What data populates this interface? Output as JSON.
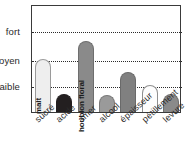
{
  "chart_data": {
    "type": "bar",
    "title": "",
    "xlabel": "",
    "ylabel": "",
    "categories": [
      "sucré",
      "acide",
      "amer",
      "alcool",
      "épaisseur",
      "pétillement",
      "levure"
    ],
    "values": [
      "moyen",
      "très faible",
      "entre moyen et fort",
      "très faible",
      "entre faible et moyen",
      "faible",
      "très faible"
    ],
    "ytick_labels": [
      "fort",
      "moyen",
      "faible"
    ],
    "ylim": [
      "nul",
      "fort+"
    ],
    "grid": true,
    "legend": "none",
    "bars": [
      {
        "category": "sucré",
        "level_label": "moyen",
        "value": 0.49,
        "caption": "malt",
        "fill": "#eeeeee",
        "stroke": "#9a9a9a",
        "caption_class": "dark-text"
      },
      {
        "category": "acide",
        "level_label": "très faible",
        "value": 0.167,
        "caption": "",
        "fill": "#231f20",
        "stroke": "#231f20",
        "caption_class": "light-text"
      },
      {
        "category": "amer",
        "level_label": "entre moyen et fort",
        "value": 0.657,
        "caption": "houblon floral",
        "fill": "#8a8a8a",
        "stroke": "#6e6e6e",
        "caption_class": "dark-text"
      },
      {
        "category": "alcool",
        "level_label": "très faible",
        "value": 0.157,
        "caption": "",
        "fill": "#9a9a9a",
        "stroke": "#7a7a7a",
        "caption_class": "dark-text"
      },
      {
        "category": "épaisseur",
        "level_label": "entre faible et moyen",
        "value": 0.37,
        "caption": "",
        "fill": "#808080",
        "stroke": "#6a6a6a",
        "caption_class": "dark-text"
      },
      {
        "category": "pétillement",
        "level_label": "faible",
        "value": 0.25,
        "caption": "",
        "fill": "#fdfdfd",
        "stroke": "#8f8f8f",
        "caption_class": "dark-text"
      },
      {
        "category": "levure",
        "level_label": "très faible",
        "value": 0.167,
        "caption": "",
        "fill": "#8a8a8a",
        "stroke": "#6e6e6e",
        "caption_class": "dark-text"
      }
    ],
    "gridlines": [
      {
        "label": "fort",
        "pos": 0.759
      },
      {
        "label": "moyen",
        "pos": 0.49
      },
      {
        "label": "faible",
        "pos": 0.25
      }
    ],
    "colors": {
      "frame": "#3a3a3a",
      "grid": "#2b2b2b",
      "text": "#2b2b2b",
      "background": "#ffffff"
    }
  }
}
